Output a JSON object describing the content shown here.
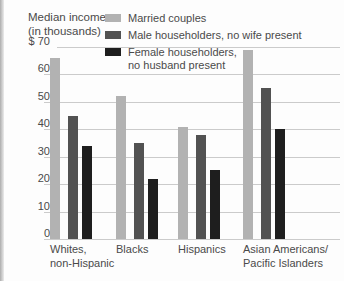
{
  "title": {
    "line1": "Median income",
    "line2": "(in thousands)"
  },
  "axis": {
    "y_ticks": [
      {
        "label": "$ 70",
        "value": 70
      },
      {
        "label": "60",
        "value": 60
      },
      {
        "label": "50",
        "value": 50
      },
      {
        "label": "40",
        "value": 40
      },
      {
        "label": "30",
        "value": 30
      },
      {
        "label": "20",
        "value": 20
      },
      {
        "label": "10",
        "value": 10
      },
      {
        "label": "0",
        "value": 0
      }
    ]
  },
  "legend": {
    "items": [
      {
        "label": "Married couples",
        "color": "#b2b2b2"
      },
      {
        "label": "Male householders, no wife present",
        "color": "#525252"
      },
      {
        "label": "Female householders,\nno husband present",
        "color": "#1e1e1e"
      }
    ]
  },
  "chart_data": {
    "type": "bar",
    "title": "Median income (in thousands)",
    "xlabel": "",
    "ylabel": "Median income (in thousands of dollars)",
    "ylim": [
      0,
      70
    ],
    "grid": true,
    "legend_position": "top",
    "categories": [
      "Whites,\nnon-Hispanic",
      "Blacks",
      "Hispanics",
      "Asian Americans/\nPacific Islanders"
    ],
    "category_slugs": [
      "whites-non-hispanic",
      "blacks",
      "hispanics",
      "asian-pacific-islanders"
    ],
    "series": [
      {
        "name": "Married couples",
        "slug": "married-couples",
        "color": "#b2b2b2",
        "values": [
          66,
          52,
          41,
          69
        ]
      },
      {
        "name": "Male householders, no wife present",
        "slug": "male-householders",
        "color": "#525252",
        "values": [
          45,
          35,
          38,
          55
        ]
      },
      {
        "name": "Female householders, no husband present",
        "slug": "female-householders",
        "color": "#1e1e1e",
        "values": [
          34,
          22,
          25,
          40
        ]
      }
    ]
  }
}
